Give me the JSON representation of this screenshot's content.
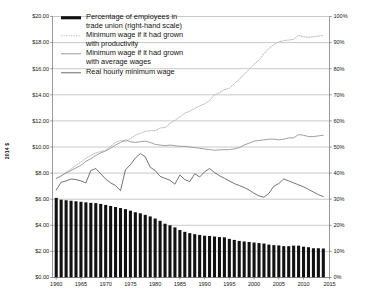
{
  "chart_data": {
    "type": "bar",
    "title": "",
    "subtitle": "",
    "xlabel": "",
    "ylabel": "2014 $",
    "ylabel_right": "",
    "grid": true,
    "legend_position": "top-left-inside",
    "xlim": [
      1960,
      2015
    ],
    "ylim": [
      0,
      20
    ],
    "ylim_right": [
      0,
      100
    ],
    "x_tick_labels": [
      "1960",
      "1965",
      "1970",
      "1975",
      "1980",
      "1985",
      "1990",
      "1995",
      "2000",
      "2005",
      "2010",
      "2015"
    ],
    "x_tick_values": [
      1960,
      1965,
      1970,
      1975,
      1980,
      1985,
      1990,
      1995,
      2000,
      2005,
      2010,
      2015
    ],
    "y_tick_labels": [
      "$0.00",
      "$2.00",
      "$4.00",
      "$6.00",
      "$8.00",
      "$10.00",
      "$12.00",
      "$14.00",
      "$16.00",
      "$18.00",
      "$20.00"
    ],
    "y_tick_values": [
      0,
      2,
      4,
      6,
      8,
      10,
      12,
      14,
      16,
      18,
      20
    ],
    "y_right_tick_labels": [
      "0%",
      "10%",
      "20%",
      "30%",
      "40%",
      "50%",
      "60%",
      "70%",
      "80%",
      "90%",
      "100%"
    ],
    "y_right_tick_values": [
      0,
      10,
      20,
      30,
      40,
      50,
      60,
      70,
      80,
      90,
      100
    ],
    "x": [
      1960,
      1961,
      1962,
      1963,
      1964,
      1965,
      1966,
      1967,
      1968,
      1969,
      1970,
      1971,
      1972,
      1973,
      1974,
      1975,
      1976,
      1977,
      1978,
      1979,
      1980,
      1981,
      1982,
      1983,
      1984,
      1985,
      1986,
      1987,
      1988,
      1989,
      1990,
      1991,
      1992,
      1993,
      1994,
      1995,
      1996,
      1997,
      1998,
      1999,
      2000,
      2001,
      2002,
      2003,
      2004,
      2005,
      2006,
      2007,
      2008,
      2009,
      2010,
      2011,
      2012,
      2013,
      2014
    ],
    "series": [
      {
        "name": "Percentage of employees in trade union (right-hand scale)",
        "type": "bar",
        "axis": "right",
        "unit": "%",
        "color": "#111111",
        "values": [
          30.5,
          29.8,
          29.6,
          29.4,
          29.2,
          29.0,
          28.8,
          28.6,
          28.5,
          28.2,
          27.8,
          27.4,
          27.0,
          26.6,
          26.2,
          25.6,
          25.0,
          24.6,
          24.0,
          23.4,
          22.6,
          21.7,
          20.6,
          20.0,
          19.2,
          18.2,
          17.5,
          17.0,
          16.6,
          16.3,
          16.0,
          15.9,
          15.7,
          15.5,
          15.4,
          14.8,
          14.4,
          14.0,
          13.8,
          13.6,
          13.4,
          13.2,
          13.0,
          12.6,
          12.4,
          12.3,
          12.0,
          12.0,
          12.2,
          12.2,
          11.8,
          11.6,
          11.2,
          11.2,
          11.1
        ]
      },
      {
        "name": "Minimum wage if it had grown with productivity",
        "type": "line",
        "style": "dotted",
        "axis": "left",
        "unit": "$",
        "color": "#b9b9b9",
        "values": [
          7.55,
          7.75,
          8.05,
          8.3,
          8.6,
          8.85,
          9.15,
          9.35,
          9.55,
          9.65,
          9.75,
          10.05,
          10.35,
          10.5,
          10.4,
          10.65,
          10.9,
          11.05,
          11.2,
          11.25,
          11.25,
          11.45,
          11.5,
          11.8,
          12.05,
          12.3,
          12.6,
          12.75,
          12.95,
          13.15,
          13.3,
          13.55,
          14.0,
          14.15,
          14.4,
          14.5,
          14.85,
          15.2,
          15.55,
          15.95,
          16.35,
          16.65,
          17.15,
          17.55,
          17.85,
          18.05,
          18.15,
          18.2,
          18.25,
          18.55,
          18.45,
          18.4,
          18.45,
          18.5,
          18.55
        ]
      },
      {
        "name": "Minimum wage if it had grown with average wages",
        "type": "line",
        "style": "solid",
        "axis": "left",
        "unit": "$",
        "color": "#8f8f8f",
        "values": [
          7.6,
          7.8,
          8.0,
          8.2,
          8.4,
          8.6,
          8.9,
          9.1,
          9.35,
          9.55,
          9.7,
          9.9,
          10.15,
          10.35,
          10.55,
          10.4,
          10.35,
          10.4,
          10.45,
          10.35,
          10.2,
          10.15,
          10.1,
          10.15,
          10.1,
          10.05,
          10.05,
          10.0,
          9.95,
          9.9,
          9.85,
          9.8,
          9.75,
          9.78,
          9.8,
          9.8,
          9.85,
          9.95,
          10.15,
          10.3,
          10.45,
          10.5,
          10.55,
          10.6,
          10.6,
          10.55,
          10.6,
          10.7,
          10.7,
          10.95,
          10.9,
          10.8,
          10.8,
          10.85,
          10.9
        ]
      },
      {
        "name": "Real hourly minimum wage",
        "type": "line",
        "style": "solid",
        "axis": "left",
        "unit": "$",
        "color": "#5a5a5a",
        "values": [
          6.7,
          7.3,
          7.4,
          7.55,
          7.5,
          7.4,
          7.25,
          8.2,
          8.35,
          7.95,
          7.55,
          7.25,
          7.05,
          6.65,
          8.25,
          8.65,
          9.15,
          9.5,
          9.25,
          8.45,
          8.2,
          7.75,
          7.6,
          7.45,
          7.15,
          7.85,
          7.5,
          7.35,
          7.95,
          7.7,
          8.1,
          8.35,
          8.05,
          7.8,
          7.6,
          7.4,
          7.2,
          7.05,
          6.9,
          6.7,
          6.45,
          6.25,
          6.15,
          6.45,
          7.0,
          7.2,
          7.55,
          7.4,
          7.25,
          7.1,
          6.95,
          6.75,
          6.55,
          6.35,
          6.2
        ]
      }
    ]
  },
  "legend": {
    "entries": [
      {
        "label_line1": "Percentage of employees in",
        "label_line2": "trade union (right-hand scale)",
        "swatch": "thick-black-bar"
      },
      {
        "label_line1": "Minimum wage if it had grown",
        "label_line2": "with productivity",
        "swatch": "dotted-light-line"
      },
      {
        "label_line1": "Minimum wage if it had grown",
        "label_line2": "with average wages",
        "swatch": "solid-gray-line"
      },
      {
        "label_line1": "Real hourly minimum wage",
        "label_line2": "",
        "swatch": "solid-dark-line"
      }
    ]
  },
  "axes": {
    "left_title": "2014 $"
  },
  "colors": {
    "bar": "#111111",
    "productivity_line": "#b9b9b9",
    "average_wage_line": "#8f8f8f",
    "real_min_wage_line": "#5a5a5a",
    "gridline": "#9a9a9a",
    "axis": "#6f6f6f",
    "background": "#ffffff"
  }
}
